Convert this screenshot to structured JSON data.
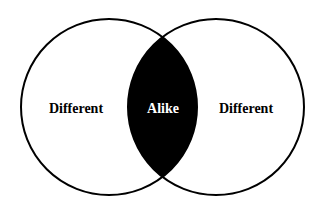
{
  "diagram": {
    "type": "venn",
    "background": "#ffffff",
    "stroke_color": "#000000",
    "intersection_fill": "#000000",
    "circles": [
      {
        "name": "left",
        "cx": 109,
        "cy": 107,
        "r": 88
      },
      {
        "name": "right",
        "cx": 216,
        "cy": 107,
        "r": 88
      }
    ],
    "labels": {
      "left": "Different",
      "center": "Alike",
      "right": "Different"
    },
    "label_colors": {
      "left": "#000000",
      "center": "#ffffff",
      "right": "#000000"
    }
  }
}
